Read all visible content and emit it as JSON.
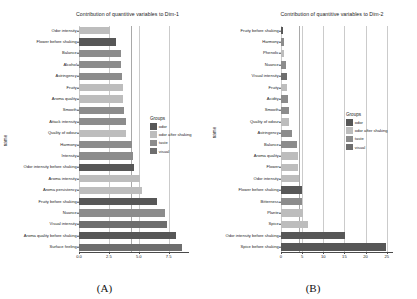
{
  "figure": {
    "panels": [
      {
        "id": "A",
        "caption": "(A)",
        "title": "Contribution of quantitive variables to Dim-1",
        "ylabel": "name",
        "chart_data": {
          "type": "bar",
          "orientation": "horizontal",
          "title": "Contribution of quantitive variables to Dim-1",
          "xlabel": "",
          "ylabel": "name",
          "xlim": [
            0,
            9.2
          ],
          "xticks": [
            "0.0",
            "2.5",
            "5.0",
            "7.5"
          ],
          "xtickvalues": [
            0,
            2.5,
            5.0,
            7.5
          ],
          "grid": true,
          "reference_line": 4.35,
          "legend_position": "right",
          "categories": [
            "Odor intensity",
            "Flower before shaking",
            "Balance",
            "Alcohol",
            "Astringency",
            "Fruity",
            "Aroma quality",
            "Smooth",
            "Attack intensity",
            "Quality of odour",
            "Harmony",
            "Intensity",
            "Odor intensity before shaking",
            "Aroma intensity",
            "Aroma persistency",
            "Fruity before shaking",
            "Nuance",
            "Visual intensity",
            "Aroma quality before shaking",
            "Surface feeling"
          ],
          "values": [
            2.6,
            3.1,
            3.5,
            3.5,
            3.6,
            3.7,
            3.7,
            3.8,
            3.9,
            3.9,
            4.4,
            4.5,
            4.6,
            5.1,
            5.3,
            6.5,
            7.2,
            7.4,
            8.1,
            8.6
          ],
          "groups": [
            "odor after shaking",
            "odor",
            "taste",
            "taste",
            "taste",
            "odor after shaking",
            "odor after shaking",
            "taste",
            "taste",
            "odor after shaking",
            "taste",
            "taste",
            "odor",
            "odor after shaking",
            "odor after shaking",
            "odor",
            "taste",
            "visual",
            "odor",
            "visual"
          ]
        }
      },
      {
        "id": "B",
        "caption": "(B)",
        "title": "Contribution of quantitive variables to Dim-2",
        "ylabel": "name",
        "chart_data": {
          "type": "bar",
          "orientation": "horizontal",
          "title": "Contribution of quantitive variables to Dim-2",
          "xlabel": "",
          "ylabel": "name",
          "xlim": [
            0,
            26.5
          ],
          "xticks": [
            "0",
            "5",
            "10",
            "15",
            "20",
            "25"
          ],
          "xtickvalues": [
            0,
            5,
            10,
            15,
            20,
            25
          ],
          "grid": true,
          "reference_line": 4.35,
          "legend_position": "right",
          "categories": [
            "Fruity before shaking",
            "Harmony",
            "Phenolic",
            "Nuance",
            "Visual intensity",
            "Fruity",
            "Acidity",
            "Smooth",
            "Quality of odour",
            "Astringency",
            "Balance",
            "Aroma quality",
            "Flower",
            "Odor intensity",
            "Flower before shaking",
            "Bitterness",
            "Plante",
            "Spice",
            "Odor intensity before shaking",
            "Spice before shaking"
          ],
          "values": [
            0.5,
            0.6,
            0.7,
            1.3,
            1.4,
            1.5,
            1.6,
            1.8,
            2.0,
            2.6,
            3.9,
            4.0,
            4.1,
            4.2,
            4.9,
            4.9,
            5.3,
            6.3,
            15.2,
            24.8
          ],
          "groups": [
            "odor",
            "taste",
            "odor after shaking",
            "taste",
            "visual",
            "odor after shaking",
            "taste",
            "taste",
            "odor after shaking",
            "taste",
            "taste",
            "odor after shaking",
            "odor after shaking",
            "odor after shaking",
            "odor",
            "taste",
            "odor after shaking",
            "odor after shaking",
            "odor",
            "odor"
          ]
        }
      }
    ],
    "legend": {
      "title": "Groups",
      "items": [
        {
          "label": "odor",
          "color": "#575757"
        },
        {
          "label": "odor after shaking",
          "color": "#bdbdbd"
        },
        {
          "label": "taste",
          "color": "#8c8c8c"
        },
        {
          "label": "visual",
          "color": "#6e6e6e"
        }
      ]
    },
    "colors": {
      "odor": "#575757",
      "odor after shaking": "#bdbdbd",
      "taste": "#8c8c8c",
      "visual": "#6e6e6e",
      "axis": "#4a4a4a",
      "grid": "#c2c2c2",
      "reference": "#9a9a9a",
      "text": "#232323",
      "background": "#ffffff"
    }
  }
}
